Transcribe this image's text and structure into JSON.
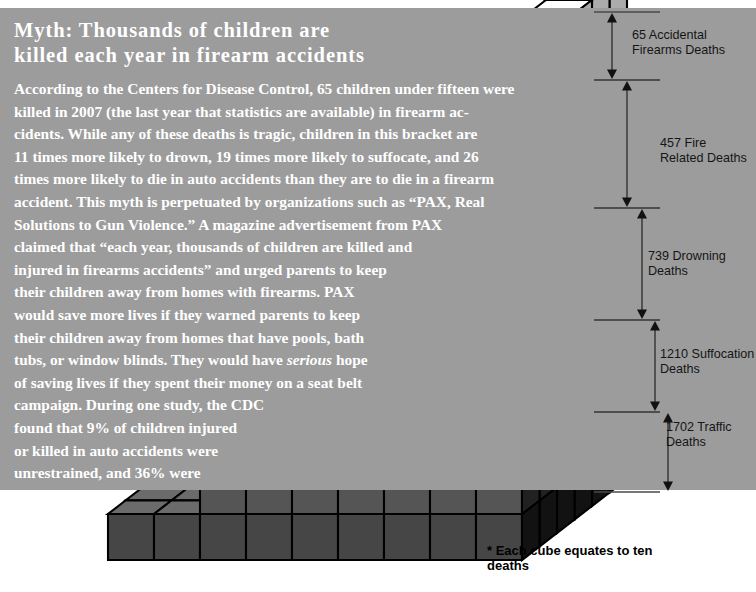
{
  "page": {
    "background_color": "#ffffff",
    "panel_color": "#9c9c9c",
    "text_color": "#ffffff",
    "ink_color": "#151515"
  },
  "panel": {
    "title": "Myth:  Thousands of children are killed each year in firearm accidents",
    "title_lines": [
      "Myth:  Thousands of children are",
      "killed each year in firearm accidents"
    ],
    "body_lines": [
      "According to the Centers for Disease Control, 65 children under fifteen were",
      "killed in 2007 (the last year that statistics are available) in firearm ac-",
      "cidents.  While any of these deaths is tragic, children in this bracket are",
      "11 times more likely to drown, 19 times more likely to suffocate, and 26",
      "times more likely to die in auto accidents than they are to die in a firearm",
      "accident.  This myth is perpetuated by organizations such as “PAX, Real",
      "Solutions to Gun Violence.”  A magazine advertisement from PAX",
      "claimed that “each year, thousands of children are killed and",
      "injured in firearms accidents” and urged parents to keep",
      "their children away from homes with firearms.  PAX",
      "would save more lives if they warned parents to keep",
      "their children away from homes that have pools, bath",
      "tubs, or window blinds.  They would have |serious| hope",
      "of saving lives if they spent their money on a seat belt",
      "campaign.  During one study, the CDC",
      "found that 9% of children injured",
      "or killed in auto accidents were",
      "unrestrained, and 36% were",
      "improperly restrained."
    ]
  },
  "measurements": [
    {
      "id": "accidental-firearms",
      "label": "65 Accidental\nFirearms Deaths",
      "value": 65,
      "cause": "Accidental Firearms Deaths",
      "top": 12,
      "bottom": 80,
      "label_x": 632,
      "label_y": 28
    },
    {
      "id": "fire-related",
      "label": "457 Fire\nRelated Deaths",
      "value": 457,
      "cause": "Fire Related Deaths",
      "top": 80,
      "bottom": 208,
      "label_x": 660,
      "label_y": 136
    },
    {
      "id": "drowning",
      "label": "739 Drowning\nDeaths",
      "value": 739,
      "cause": "Drowning Deaths",
      "top": 208,
      "bottom": 320,
      "label_x": 648,
      "label_y": 249
    },
    {
      "id": "suffocation",
      "label": "1210 Suffocation\nDeaths",
      "value": 1210,
      "cause": "Suffocation Deaths",
      "top": 320,
      "bottom": 412,
      "label_x": 660,
      "label_y": 347
    },
    {
      "id": "traffic",
      "label": "1702 Traffic\nDeaths",
      "value": 1702,
      "cause": "Traffic Deaths",
      "top": 412,
      "bottom": 492,
      "label_x": 666,
      "label_y": 420
    }
  ],
  "footnote": {
    "text": "* Each cube equates to ten\n    deaths"
  },
  "chart_data": {
    "type": "bar",
    "subtitle": "Causes of death for children under fifteen, 2007 (CDC)",
    "unit": "deaths",
    "cube_value": 10,
    "categories": [
      "Accidental Firearms",
      "Fire Related",
      "Drowning",
      "Suffocation",
      "Traffic"
    ],
    "values": [
      65,
      457,
      739,
      1210,
      1702
    ],
    "labels": [
      "65 Accidental Firearms Deaths",
      "457 Fire Related Deaths",
      "739 Drowning Deaths",
      "1210 Suffocation Deaths",
      "1702 Traffic Deaths"
    ],
    "xlabel": "",
    "ylabel": "Deaths",
    "ylim": [
      0,
      4173
    ],
    "grid": false,
    "legend": "none",
    "note": "Stacked isometric cube pyramid; each cube equates to ten deaths"
  }
}
